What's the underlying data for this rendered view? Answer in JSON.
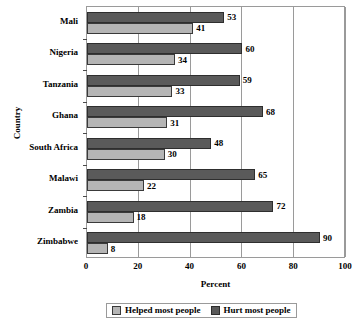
{
  "chart_data": {
    "type": "bar",
    "orientation": "horizontal",
    "title": "",
    "xlabel": "Percent",
    "ylabel": "Country",
    "xlim": [
      0,
      100
    ],
    "xticks": [
      0,
      20,
      40,
      60,
      80,
      100
    ],
    "grid": true,
    "legend_position": "bottom",
    "categories": [
      "Mali",
      "Nigeria",
      "Tanzania",
      "Ghana",
      "South Africa",
      "Malawi",
      "Zambia",
      "Zimbabwe"
    ],
    "series": [
      {
        "name": "Hurt most people",
        "color": "#5a5a5a",
        "values": [
          53,
          60,
          59,
          68,
          48,
          65,
          72,
          90
        ]
      },
      {
        "name": "Helped most people",
        "color": "#b5b5b5",
        "values": [
          41,
          34,
          33,
          31,
          30,
          22,
          18,
          8
        ]
      }
    ]
  },
  "legend": {
    "items": [
      {
        "label": "Helped most people",
        "swatch": "helped"
      },
      {
        "label": "Hurt most people",
        "swatch": "hurt"
      }
    ]
  }
}
